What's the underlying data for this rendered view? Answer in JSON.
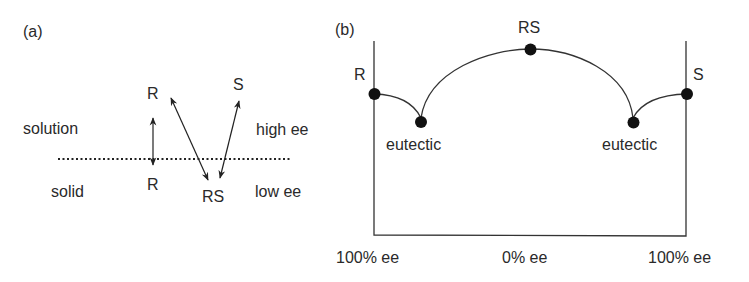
{
  "panel_a": {
    "label": "(a)",
    "regions": {
      "top_left": "solution",
      "bottom_left": "solid",
      "top_right": "high ee",
      "bottom_right": "low ee"
    },
    "species": {
      "r_solution": "R",
      "r_solid": "R",
      "s_solution": "S",
      "rs_solid": "RS"
    },
    "arrows": [
      {
        "from": "R (solid)",
        "to": "R (solution)",
        "type": "double-headed"
      },
      {
        "from": "RS (solid)",
        "to": "R (solution)",
        "type": "double-headed"
      },
      {
        "from": "RS (solid)",
        "to": "S (solution)",
        "type": "double-headed"
      }
    ],
    "divider": "dotted phase boundary"
  },
  "panel_b": {
    "label": "(b)",
    "points": {
      "r": "R",
      "rs": "RS",
      "s": "S",
      "eutectic_left": "eutectic",
      "eutectic_right": "eutectic"
    },
    "x_axis": {
      "left": "100% ee",
      "center": "0% ee",
      "right": "100% ee"
    }
  },
  "colors": {
    "line": "#333333",
    "dot": "#111111",
    "text": "#2a2a2a"
  }
}
